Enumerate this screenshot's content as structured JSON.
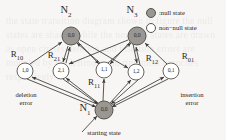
{
  "figure": {
    "type": "state-transition-diagram",
    "background_color": "#f7f6f4",
    "ink_color": "#2b2926",
    "null_state_fill": "#9a9792",
    "non_null_state_fill": "#ffffff",
    "stroke_color": "#57544f"
  },
  "legend": {
    "items": [
      {
        "marker": "filled-circle",
        "label": ":null state",
        "swatch": "#9a9792"
      },
      {
        "marker": "open-circle",
        "label": "non−null state",
        "swatch": "#ffffff"
      }
    ]
  },
  "column_labels": [
    {
      "id": "N1",
      "text": "N",
      "sub": "1"
    },
    {
      "id": "N2",
      "text": "N",
      "sub": "2"
    },
    {
      "id": "N3",
      "text": "N",
      "sub": "3"
    }
  ],
  "nodes": [
    {
      "id": "top-left",
      "label": "0,0",
      "kind": "null-state",
      "x": 71,
      "y": 36,
      "r": 9
    },
    {
      "id": "top-right",
      "label": "0,0",
      "kind": "null-state",
      "x": 137,
      "y": 36,
      "r": 9
    },
    {
      "id": "mid-1",
      "label": "1,0",
      "kind": "non-null-state",
      "x": 25,
      "y": 71,
      "r": 8
    },
    {
      "id": "mid-2",
      "label": "2,1",
      "kind": "non-null-state",
      "x": 61,
      "y": 71,
      "r": 8
    },
    {
      "id": "mid-3",
      "label": "1,1",
      "kind": "non-null-state",
      "x": 104,
      "y": 70,
      "r": 8
    },
    {
      "id": "mid-4",
      "label": "1,2",
      "kind": "non-null-state",
      "x": 136,
      "y": 72,
      "r": 8
    },
    {
      "id": "mid-5",
      "label": "0,1",
      "kind": "non-null-state",
      "x": 171,
      "y": 71,
      "r": 8
    },
    {
      "id": "bottom",
      "label": "0,0",
      "kind": "null-state",
      "x": 104,
      "y": 110,
      "r": 9
    }
  ],
  "edge_labels": [
    {
      "id": "R10",
      "text": "R",
      "sub": "10",
      "x": 17,
      "y": 56
    },
    {
      "id": "R21",
      "text": "R",
      "sub": "21",
      "x": 54,
      "y": 57
    },
    {
      "id": "R11",
      "text": "R",
      "sub": "11",
      "x": 94,
      "y": 84
    },
    {
      "id": "R12",
      "text": "R",
      "sub": "12",
      "x": 152,
      "y": 60
    },
    {
      "id": "R01",
      "text": "R",
      "sub": "01",
      "x": 188,
      "y": 58
    }
  ],
  "annotations": [
    {
      "id": "deletion-error",
      "line1": "deletion",
      "line2": "error",
      "x": 26,
      "y": 91
    },
    {
      "id": "insertion-error",
      "line1": "insertion",
      "line2": "error",
      "x": 192,
      "y": 91
    },
    {
      "id": "starting-state",
      "line1": "starting state",
      "line2": "",
      "x": 104,
      "y": 130
    }
  ],
  "node_label_positions": {
    "N1": {
      "x": 85,
      "y": 110
    },
    "N2": {
      "x": 66,
      "y": 12
    },
    "N3": {
      "x": 132,
      "y": 12
    }
  },
  "legend_layout": {
    "dot1": {
      "x": 151,
      "y": 13
    },
    "text1": {
      "x": 159,
      "y": 13
    },
    "dot2": {
      "x": 151,
      "y": 28
    },
    "text2": {
      "x": 159,
      "y": 28
    }
  },
  "bleed_text": "the state transition diagram shown in figure the null states are shaded while the non null states are drawn as open circles deletion and insertion errors are modeled by the leftmost and rightmost branches respectively"
}
